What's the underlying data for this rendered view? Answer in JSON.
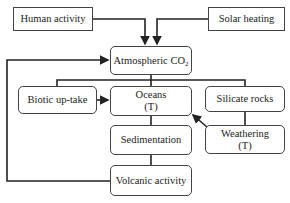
{
  "diagram": {
    "nodes": {
      "human_activity": {
        "label": "Human activity"
      },
      "solar_heating": {
        "label": "Solar heating"
      },
      "atmospheric_co2": {
        "label": "Atmospheric CO",
        "subscript": "2"
      },
      "biotic_uptake": {
        "label": "Biotic up-take"
      },
      "oceans": {
        "label": "Oceans",
        "sublabel": "(T)"
      },
      "silicate_rocks": {
        "label": "Silicate rocks"
      },
      "sedimentation": {
        "label": "Sedimentation"
      },
      "weathering": {
        "label": "Weathering",
        "sublabel": "(T)"
      },
      "volcanic_activity": {
        "label": "Volcanic activity"
      }
    },
    "edges": [
      {
        "from": "Human activity",
        "to": "Atmospheric CO2",
        "arrow": true
      },
      {
        "from": "Solar heating",
        "to": "Atmospheric CO2",
        "arrow": true
      },
      {
        "from": "Atmospheric CO2",
        "to": "Biotic up-take / Oceans / Silicate rocks",
        "arrow": false
      },
      {
        "from": "Biotic up-take",
        "to": "Oceans",
        "arrow": true
      },
      {
        "from": "Silicate rocks",
        "to": "Weathering",
        "arrow": false
      },
      {
        "from": "Weathering",
        "to": "Oceans",
        "arrow": true
      },
      {
        "from": "Oceans",
        "to": "Sedimentation",
        "arrow": false
      },
      {
        "from": "Sedimentation",
        "to": "Volcanic activity",
        "arrow": false
      },
      {
        "from": "Volcanic activity",
        "to": "Atmospheric CO2",
        "arrow": true
      }
    ],
    "line_color": "#222222"
  }
}
